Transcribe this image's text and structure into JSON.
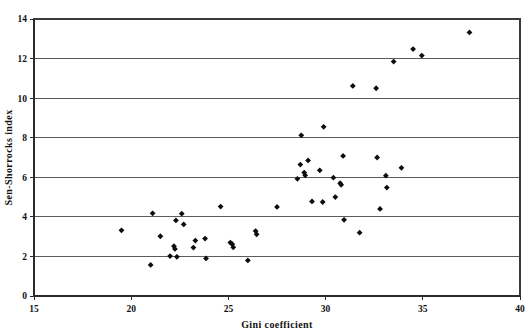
{
  "chart_data": {
    "type": "scatter",
    "title": "",
    "xlabel": "Gini coefficient",
    "ylabel": "Sen-Shorrocks index",
    "xlim": [
      15,
      40
    ],
    "ylim": [
      0,
      14
    ],
    "xticks": [
      15,
      20,
      25,
      30,
      35,
      40
    ],
    "yticks": [
      0,
      2,
      4,
      6,
      8,
      10,
      12,
      14
    ],
    "xtick_labels": [
      "15",
      "20",
      "25",
      "30",
      "35",
      "40"
    ],
    "ytick_labels": [
      "0",
      "2",
      "4",
      "6",
      "8",
      "10",
      "12",
      "14"
    ],
    "grid": "horizontal",
    "legend": "none",
    "marker": "filled-diamond",
    "marker_color": "#0d0d0d",
    "series": [
      {
        "name": "countries",
        "points": [
          [
            19.5,
            3.32
          ],
          [
            21.0,
            1.57
          ],
          [
            21.1,
            4.18
          ],
          [
            21.5,
            3.02
          ],
          [
            22.0,
            2.02
          ],
          [
            22.2,
            2.52
          ],
          [
            22.25,
            2.38
          ],
          [
            22.3,
            3.82
          ],
          [
            22.35,
            1.98
          ],
          [
            22.6,
            4.16
          ],
          [
            22.7,
            3.62
          ],
          [
            23.2,
            2.45
          ],
          [
            23.3,
            2.8
          ],
          [
            23.8,
            2.9
          ],
          [
            23.85,
            1.9
          ],
          [
            24.6,
            4.52
          ],
          [
            25.1,
            2.7
          ],
          [
            25.2,
            2.62
          ],
          [
            25.25,
            2.46
          ],
          [
            26.0,
            1.8
          ],
          [
            26.4,
            3.28
          ],
          [
            26.45,
            3.12
          ],
          [
            27.5,
            4.5
          ],
          [
            28.55,
            5.92
          ],
          [
            28.7,
            6.64
          ],
          [
            28.75,
            8.12
          ],
          [
            28.9,
            6.24
          ],
          [
            28.95,
            6.1
          ],
          [
            29.1,
            6.85
          ],
          [
            29.3,
            4.78
          ],
          [
            29.7,
            6.35
          ],
          [
            29.85,
            4.75
          ],
          [
            29.9,
            8.55
          ],
          [
            30.4,
            5.98
          ],
          [
            30.5,
            5.0
          ],
          [
            30.75,
            5.7
          ],
          [
            30.8,
            5.62
          ],
          [
            30.9,
            7.08
          ],
          [
            30.95,
            3.85
          ],
          [
            31.4,
            10.62
          ],
          [
            31.75,
            3.2
          ],
          [
            32.6,
            10.5
          ],
          [
            32.65,
            7.0
          ],
          [
            32.8,
            4.4
          ],
          [
            33.1,
            6.08
          ],
          [
            33.15,
            5.48
          ],
          [
            33.5,
            11.85
          ],
          [
            33.9,
            6.48
          ],
          [
            34.5,
            12.48
          ],
          [
            34.95,
            12.15
          ],
          [
            37.4,
            13.32
          ]
        ]
      }
    ]
  },
  "figure": {
    "plot_left_px": 34,
    "plot_right_px": 520,
    "plot_top_px": 19,
    "plot_bottom_px": 296
  }
}
